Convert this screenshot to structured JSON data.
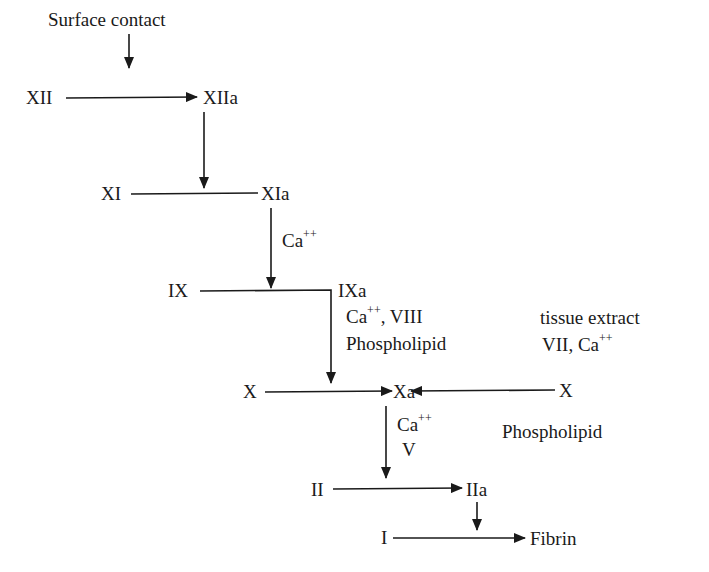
{
  "diagram": {
    "type": "coagulation-cascade",
    "nodes": {
      "surface_contact": "Surface contact",
      "xii": "XII",
      "xiia": "XIIa",
      "xi": "XI",
      "xia": "XIa",
      "ix": "IX",
      "ixa": "IXa",
      "x_left": "X",
      "xa": "Xa",
      "x_right": "X",
      "ii": "II",
      "iia": "IIa",
      "i": "I",
      "fibrin": "Fibrin"
    },
    "cofactors": {
      "xia_to_ix": {
        "base": "Ca",
        "sup": "++"
      },
      "ixa_line1": {
        "base": "Ca",
        "sup": "++",
        "rest": ", VIII"
      },
      "ixa_line2": "Phospholipid",
      "extrinsic_line1": "tissue extract",
      "extrinsic_line2": {
        "pre": "VII, Ca",
        "sup": "++"
      },
      "xa_line1": {
        "base": "Ca",
        "sup": "++"
      },
      "xa_line2": "V",
      "xa_side": "Phospholipid"
    },
    "edges": [
      {
        "from": "Surface contact",
        "to": "XII→XIIa",
        "kind": "activates"
      },
      {
        "from": "XII",
        "to": "XIIa",
        "kind": "conversion"
      },
      {
        "from": "XIIa",
        "to": "XI→XIa",
        "kind": "activates"
      },
      {
        "from": "XI",
        "to": "XIa",
        "kind": "conversion"
      },
      {
        "from": "XIa",
        "to": "IX→IXa",
        "kind": "activates",
        "cofactors": [
          "Ca++"
        ]
      },
      {
        "from": "IX",
        "to": "IXa",
        "kind": "conversion"
      },
      {
        "from": "IXa",
        "to": "X→Xa",
        "kind": "activates",
        "cofactors": [
          "Ca++",
          "VIII",
          "Phospholipid"
        ]
      },
      {
        "from": "X (left)",
        "to": "Xa",
        "kind": "conversion"
      },
      {
        "from": "X (right)",
        "to": "Xa",
        "kind": "conversion",
        "cofactors": [
          "tissue extract",
          "VII",
          "Ca++"
        ]
      },
      {
        "from": "Xa",
        "to": "II→IIa",
        "kind": "activates",
        "cofactors": [
          "Ca++",
          "V",
          "Phospholipid"
        ]
      },
      {
        "from": "II",
        "to": "IIa",
        "kind": "conversion"
      },
      {
        "from": "IIa",
        "to": "I→Fibrin",
        "kind": "activates"
      },
      {
        "from": "I",
        "to": "Fibrin",
        "kind": "conversion"
      }
    ],
    "colors": {
      "ink": "#1a1a1a",
      "background": "#ffffff"
    }
  }
}
